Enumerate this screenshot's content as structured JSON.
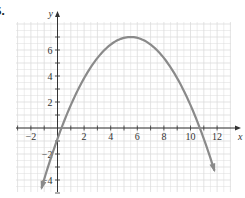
{
  "problem_label": "5.",
  "chart_data": {
    "type": "line",
    "title": "",
    "xlabel": "x",
    "ylabel": "y",
    "xlim": [
      -3,
      13
    ],
    "ylim": [
      -5,
      8
    ],
    "grid": true,
    "x_ticks": [
      -2,
      2,
      4,
      6,
      8,
      10,
      12
    ],
    "y_ticks": [
      -4,
      -2,
      2,
      4,
      6
    ],
    "x_tick_labels": [
      "−2",
      "2",
      "4",
      "6",
      "8",
      "10",
      "12"
    ],
    "y_tick_labels": [
      "−4",
      "−2",
      "2",
      "4",
      "6"
    ],
    "series": [
      {
        "name": "parabola",
        "description": "downward-opening parabola with arrows at both ends",
        "vertex": [
          5.5,
          7
        ],
        "x_intercepts": [
          0.3,
          10.7
        ],
        "x": [
          -1.2,
          0,
          1,
          2,
          3,
          4,
          5,
          5.5,
          6,
          7,
          8,
          9,
          10,
          11,
          11.8
        ],
        "y": [
          -4.6,
          -0.8,
          1.8,
          3.8,
          5.4,
          6.4,
          6.9,
          7,
          6.9,
          6.4,
          5.4,
          3.8,
          1.8,
          -0.8,
          -3.3
        ],
        "color": "#8a8a8a"
      }
    ],
    "colors": {
      "curve": "#8a8a8a",
      "axis": "#333333",
      "grid": "#dcdcdc"
    }
  }
}
